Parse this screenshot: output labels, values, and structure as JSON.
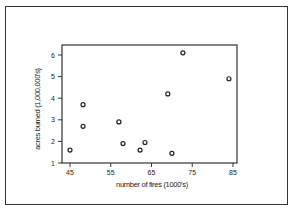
{
  "chart_data": {
    "type": "scatter",
    "title": "",
    "xlabel": "number of fires (1000's)",
    "ylabel": "acres burned (1,000,000's)",
    "xlim": [
      45,
      85
    ],
    "ylim": [
      1,
      6
    ],
    "x_ticks": [
      45,
      55,
      65,
      75,
      85
    ],
    "y_ticks": [
      1,
      2,
      3,
      4,
      5,
      6
    ],
    "grid": false,
    "legend": null,
    "marker": "open-circle",
    "points": [
      {
        "x": 45.0,
        "y": 1.6
      },
      {
        "x": 48.2,
        "y": 3.7
      },
      {
        "x": 48.2,
        "y": 2.7
      },
      {
        "x": 57.0,
        "y": 2.9
      },
      {
        "x": 58.0,
        "y": 1.9
      },
      {
        "x": 62.2,
        "y": 1.6
      },
      {
        "x": 63.4,
        "y": 1.95
      },
      {
        "x": 69.0,
        "y": 4.2
      },
      {
        "x": 70.0,
        "y": 1.45
      },
      {
        "x": 72.7,
        "y": 6.1
      },
      {
        "x": 84.0,
        "y": 4.9
      }
    ]
  }
}
